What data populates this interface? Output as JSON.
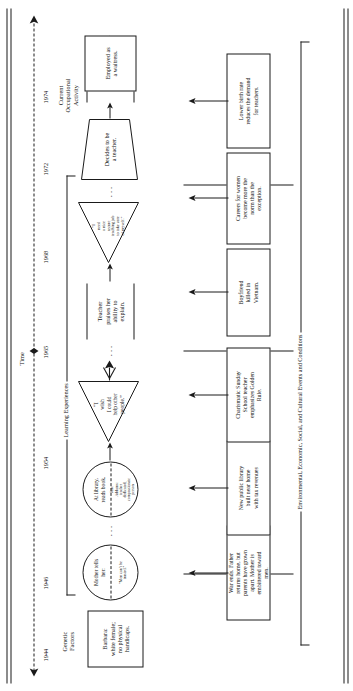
{
  "diagram": {
    "type": "life-history-flowchart",
    "orientation": "rotated-90-ccw",
    "timeline_axis_label": "Time",
    "years": [
      "1944",
      "1946",
      "1954",
      "1965",
      "1968",
      "1972",
      "1974"
    ],
    "section_labels": {
      "genetic_factors": "Genetic\nFactors",
      "learning_experiences": "Learning Experiences",
      "current_occupational_activity": "Current\nOccupational\nActivity",
      "environmental_conditions": "Environmental, Economic, Social, and Cultural Events and Conditions"
    },
    "genetic_box": {
      "text": "Barbara:\nwhite female;\nno physical\nhandicaps."
    },
    "learning_nodes": [
      {
        "id": "mother-tells-her",
        "shape": "circle",
        "top_text": "Mother tells\nher:",
        "bottom_text": "“Men can’t be\ntrusted.”"
      },
      {
        "id": "at-library-reads-book",
        "shape": "circle",
        "top_text": "At library,\nreads book.",
        "bottom_text": "Jane\nAddams:\nteacher\ndedicated,\ncompassionate\nperson"
      },
      {
        "id": "wish-help-other-people",
        "shape": "triangle",
        "text": "“I\nwish\nI could\nhelp other\npeople.”"
      },
      {
        "id": "teacher-praises-her",
        "shape": "band",
        "text": "Teacher\npraises her\nability to\nexplain."
      },
      {
        "id": "need-secure-teaching-job",
        "shape": "triangle",
        "text": "“I\nneed\na nice\nsecure\nteaching job\nto take care\nof myself.”"
      },
      {
        "id": "decides-to-be-a-teacher",
        "shape": "trapezoid",
        "text": "Decides to be\na teacher."
      },
      {
        "id": "searches-for-a-teaching-job",
        "shape": "band",
        "text": "Searches\nfor a\nteaching\njob."
      }
    ],
    "outcome_box": {
      "id": "employed-as-a-waitress",
      "text": "Employed as\na waitress."
    },
    "environment_boxes": [
      {
        "id": "war-ends-father-returns",
        "text": "War ends. Father\nreturns home, but\nparents have grown\napart. Mother is\nembittered toward\nmen."
      },
      {
        "id": "new-public-library",
        "text": "New public library\nbuilt near home\nwith tax revenues"
      },
      {
        "id": "charismatic-sunday-school-teacher",
        "text": "Charismatic Sunday\nSchool teacher\nemphasizes Golden\nRule."
      },
      {
        "id": "boyfriend-killed-in-vietnam",
        "text": "Boyfriend\nkilled in\nVietnam."
      },
      {
        "id": "careers-for-women",
        "text": "Careers for women\nbecome more the\nnorm than the\nexception."
      },
      {
        "id": "lower-birth-rate",
        "text": "Lower birth rate\nreduces the demand\nfor teachers."
      }
    ],
    "ellipsis_marks": [
      "···",
      "···",
      "···",
      "···"
    ],
    "colors": {
      "ink": "#1a1a1a",
      "paper": "#ffffff"
    }
  }
}
